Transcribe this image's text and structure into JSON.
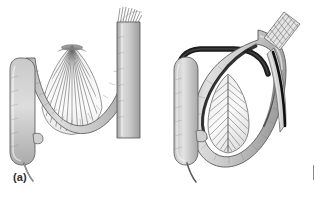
{
  "figure": {
    "background_color": "#ffffff",
    "width": 321,
    "height": 197,
    "panels": [
      {
        "id": "a",
        "label": "(a)",
        "caption_text": "(a)",
        "description": "Normal broad mesenteric root: bowel loop suspended by a wide fan-shaped mesentery with radiating vessels",
        "structures": [
          {
            "name": "cecum-with-appendix",
            "side": "left"
          },
          {
            "name": "transverse-bowel-loop",
            "side": "center"
          },
          {
            "name": "mesenteric-fan",
            "side": "center"
          },
          {
            "name": "descending-colon-column",
            "side": "right"
          },
          {
            "name": "vessel-striations",
            "side": "top-right"
          }
        ]
      },
      {
        "id": "b",
        "label": "(b)",
        "caption_text": "(b)",
        "description": "Volvulus: narrow mesenteric pedicle twisted, bowel loop rotated forming a closed loop with twisted mesentery leaf",
        "structures": [
          {
            "name": "cecum-with-appendix",
            "side": "left"
          },
          {
            "name": "twisted-bowel-loop",
            "side": "center"
          },
          {
            "name": "twisted-mesentery-leaf",
            "side": "center"
          },
          {
            "name": "cut-bowel-end-hatched",
            "side": "top-right"
          },
          {
            "name": "tapering-bowel-limb",
            "side": "right"
          }
        ]
      }
    ],
    "edge_mark": {
      "name": "page-edge-tick",
      "color": "#8a8a8a"
    },
    "colors": {
      "bowel_fill_light": "#d4d4d4",
      "bowel_fill_mid": "#bdbdbd",
      "bowel_fill_dark": "#9a9a9a",
      "outline": "#555555",
      "outline_dark": "#1a1a1a",
      "mesentery_fill": "#f2f2f2",
      "vessel_line": "#4a4a4a",
      "label_color": "#2e2e2e"
    }
  }
}
